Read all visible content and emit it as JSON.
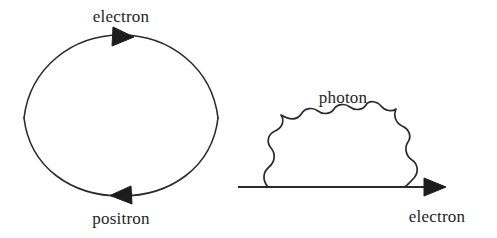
{
  "figure": {
    "background_color": "#ffffff",
    "stroke_color": "#2b2b2b",
    "text_color": "#262626"
  },
  "diagrams": [
    {
      "name": "vacuum-polarization-loop",
      "description": "closed lens-shaped fermion loop with electron on upper arc and positron on lower arc",
      "labels": {
        "top": "electron",
        "bottom": "positron"
      },
      "geometry": {
        "left_vertex_x": 24,
        "right_vertex_x": 218,
        "vertex_y": 118,
        "top_apex_y": 35,
        "bottom_apex_y": 196,
        "top_arrow_direction": "right",
        "bottom_arrow_direction": "left"
      }
    },
    {
      "name": "electron-self-energy",
      "description": "straight electron line with rightward arrow and a wavy photon arc emitted and reabsorbed",
      "labels": {
        "arc": "photon",
        "line": "electron"
      },
      "geometry": {
        "line_start_x": 238,
        "line_end_x": 445,
        "line_y": 187,
        "photon_left_foot_x": 268,
        "photon_right_foot_x": 404,
        "photon_apex_y": 118,
        "photon_wiggles": 7,
        "line_arrow_direction": "right"
      }
    }
  ]
}
